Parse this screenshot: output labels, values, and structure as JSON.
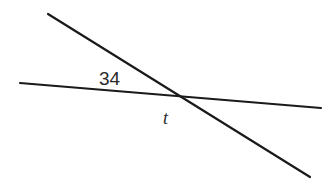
{
  "diagram": {
    "type": "intersecting-lines",
    "colors": {
      "background": "#ffffff",
      "line": "#1a1a1a",
      "text": "#2a2a2a"
    },
    "lines": [
      {
        "name": "transversal-line",
        "x1": 48,
        "y1": 14,
        "x2": 310,
        "y2": 177
      },
      {
        "name": "horizontal-line",
        "x1": 20,
        "y1": 83,
        "x2": 321,
        "y2": 108
      }
    ],
    "intersection": {
      "x": 181,
      "y": 96
    },
    "labels": {
      "angle_value": "34",
      "unknown_angle": "t"
    }
  }
}
